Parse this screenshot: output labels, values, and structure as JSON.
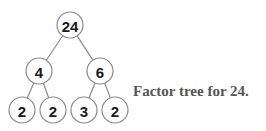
{
  "diagram": {
    "type": "factor-tree",
    "caption": "Factor tree for 24.",
    "nodes": [
      {
        "id": "n24",
        "label": "24",
        "x": 70,
        "y": 25
      },
      {
        "id": "n4",
        "label": "4",
        "x": 39,
        "y": 71
      },
      {
        "id": "n6",
        "label": "6",
        "x": 100,
        "y": 71
      },
      {
        "id": "n2a",
        "label": "2",
        "x": 22,
        "y": 110
      },
      {
        "id": "n2b",
        "label": "2",
        "x": 53,
        "y": 110
      },
      {
        "id": "n3",
        "label": "3",
        "x": 84,
        "y": 110
      },
      {
        "id": "n2c",
        "label": "2",
        "x": 115,
        "y": 110
      }
    ],
    "edges": [
      [
        "n24",
        "n4"
      ],
      [
        "n24",
        "n6"
      ],
      [
        "n4",
        "n2a"
      ],
      [
        "n4",
        "n2b"
      ],
      [
        "n6",
        "n3"
      ],
      [
        "n6",
        "n2c"
      ]
    ],
    "node_radius": 13
  }
}
